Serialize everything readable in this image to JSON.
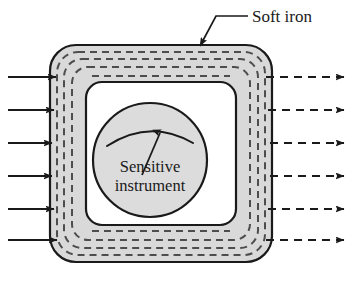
{
  "figure": {
    "type": "physics-diagram",
    "width": 352,
    "height": 281,
    "background_color": "#ffffff"
  },
  "labels": {
    "soft_iron": "Soft iron",
    "instrument_line1": "Sensitive",
    "instrument_line2": "instrument"
  },
  "colors": {
    "shield_fill": "#d9d9d9",
    "cavity_fill": "#ffffff",
    "instrument_fill": "#dcdcdc",
    "outline": "#1a1a1a",
    "field_line": "#4d4d4d",
    "text": "#1a1a1a"
  },
  "shield": {
    "name": "soft-iron-shield",
    "outer": {
      "x": 50,
      "y": 45,
      "width": 222,
      "height": 217,
      "corner_radius": 26
    },
    "inner_cavity": {
      "x": 86,
      "y": 82,
      "width": 150,
      "height": 143,
      "corner_radius": 16
    },
    "wall_thickness": 36
  },
  "instrument": {
    "name": "sensitive-instrument",
    "center_x": 150,
    "center_y": 160,
    "radius": 57,
    "gauge_arc": {
      "start_x": 108,
      "start_y": 145,
      "end_x": 192,
      "end_y": 142
    },
    "needle": {
      "pivot_x": 143,
      "pivot_y": 172,
      "tip_x": 161,
      "tip_y": 129
    }
  },
  "field_lines": {
    "count_in_wall": 3,
    "style": "dashed",
    "dash_pattern": "7,5",
    "stroke_width": 2
  },
  "incoming_arrows": {
    "name": "incoming-field-arrows",
    "count": 6,
    "style": "solid",
    "direction": "right",
    "x_start": 8,
    "x_end": 56,
    "y_positions": [
      77,
      110,
      143,
      176,
      209,
      240
    ]
  },
  "outgoing_arrows": {
    "name": "outgoing-field-arrows",
    "count": 6,
    "style": "dashed",
    "direction": "right",
    "x_start": 272,
    "x_end": 344,
    "y_positions": [
      77,
      110,
      143,
      176,
      209,
      240
    ]
  },
  "leader": {
    "name": "soft-iron-leader-line",
    "text_anchor_x": 252,
    "text_anchor_y": 22,
    "elbow_x": 244,
    "elbow_y": 16,
    "tip_x": 202,
    "tip_y": 48
  }
}
